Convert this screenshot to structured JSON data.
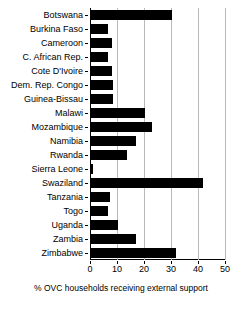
{
  "chart_data": {
    "type": "bar",
    "orientation": "horizontal",
    "title": "",
    "xlabel": "% OVC households receiving external support",
    "ylabel": "",
    "xlim": [
      0,
      50
    ],
    "xticks": [
      0,
      10,
      20,
      30,
      40,
      50
    ],
    "grid": true,
    "legend": false,
    "bar_color": "#000000",
    "categories": [
      "Botswana",
      "Burkina Faso",
      "Cameroon",
      "C. African Rep.",
      "Cote D'Ivoire",
      "Dem. Rep. Congo",
      "Guinea-Bissau",
      "Malawi",
      "Mozambique",
      "Namibia",
      "Rwanda",
      "Sierra Leone",
      "Swaziland",
      "Tanzania",
      "Togo",
      "Uganda",
      "Zambia",
      "Zimbabwe"
    ],
    "values": [
      30.0,
      6.3,
      7.8,
      6.3,
      7.8,
      8.3,
      8.0,
      20.0,
      22.6,
      16.7,
      13.3,
      0.7,
      41.5,
      7.0,
      6.3,
      10.0,
      16.7,
      31.5
    ]
  }
}
